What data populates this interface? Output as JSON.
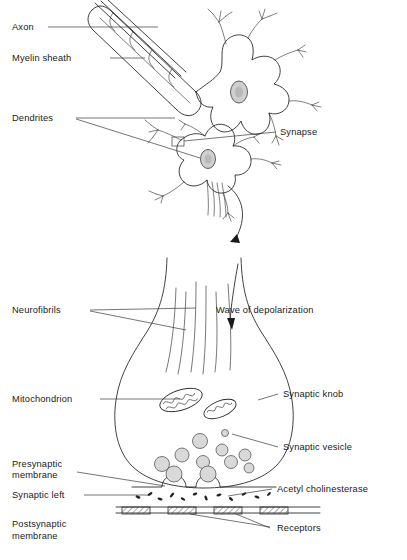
{
  "figure": {
    "background_color": "#ffffff",
    "ink_color": "#2b2b2b",
    "label_color": "#1a1a1a"
  },
  "panels": {
    "top": {
      "name": "neuron-network-panel",
      "description": "Two multipolar neurons with myelinated axon, dendrites and synapse"
    },
    "bottom": {
      "name": "synaptic-knob-panel",
      "description": "Magnified synaptic knob showing neurofibrils, mitochondria, vesicles, cleft and receptors"
    }
  },
  "labels": {
    "axon": "Axon",
    "myelin_sheath": "Myelin sheath",
    "dendrites": "Dendrites",
    "synapse": "Synapse",
    "neurofibrils": "Neurofibrils",
    "wave_of_depolarization": "Wave of depolarization",
    "mitochondrion": "Mitochondrion",
    "synaptic_knob": "Synaptic knob",
    "synaptic_vesicle": "Synaptic vesicle",
    "presynaptic_membrane_line1": "Presynaptic",
    "presynaptic_membrane_line2": "membrane",
    "synaptic_cleft": "Synaptic left",
    "acetyl_cholinesterase": "Acetyl cholinesterase",
    "postsynaptic_membrane_line1": "Postsynaptic",
    "postsynaptic_membrane_line2": "membrane",
    "receptors": "Receptors"
  },
  "structures": {
    "vesicle_count": 9,
    "fusing_vesicle_count": 2,
    "mitochondria_count": 2,
    "receptor_count": 4,
    "neuron_cell_bodies": 2,
    "neurofibril_count": 6
  }
}
